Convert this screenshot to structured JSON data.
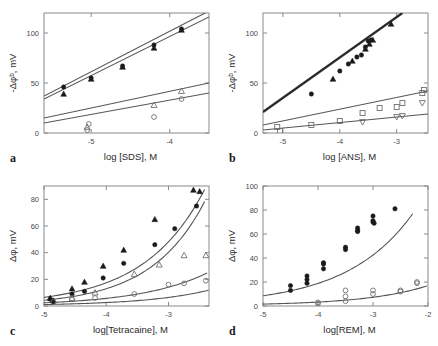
{
  "figure": {
    "background": "#ffffff",
    "width": 438,
    "height": 346,
    "marker_filled_color": "#1a1a1a",
    "marker_open_color": "#707070",
    "curve_color": "#555555",
    "axis_color": "#8a8a8a"
  },
  "panels": [
    {
      "letter": "a",
      "xlabel": "log [SDS], M",
      "ylabel": "-Δφᵇ, mV"
    },
    {
      "letter": "b",
      "xlabel": "log [ANS], M",
      "ylabel": "-Δφᵇ, mV"
    },
    {
      "letter": "c",
      "xlabel": "log[Tetracaine], M",
      "ylabel": "Δφ, mV"
    },
    {
      "letter": "d",
      "xlabel": "log[REM], M",
      "ylabel": "Δφ, mV"
    }
  ],
  "chart_data": [
    {
      "id": "panel-a",
      "type": "scatter",
      "title": "",
      "xlabel": "log [SDS], M",
      "ylabel": "-Δφᵇ, mV",
      "xlim": [
        -5.6,
        -3.5
      ],
      "ylim": [
        0,
        120
      ],
      "xticks": [
        -5,
        -4
      ],
      "yticks": [
        0,
        50,
        100
      ],
      "grid": false,
      "legend": "none",
      "series": [
        {
          "name": "filled-circle",
          "marker": "filled-circle",
          "x": [
            -5.35,
            -5.0,
            -4.6,
            -4.2,
            -3.85
          ],
          "y": [
            46,
            55,
            67,
            88,
            104
          ]
        },
        {
          "name": "filled-triangle",
          "marker": "filled-triangle",
          "x": [
            -5.35,
            -5.0,
            -4.6,
            -4.2,
            -3.85
          ],
          "y": [
            39,
            54,
            66,
            85,
            103
          ]
        },
        {
          "name": "open-triangle",
          "marker": "open-triangle",
          "x": [
            -5.05,
            -4.2,
            -3.85
          ],
          "y": [
            6,
            28,
            42
          ]
        },
        {
          "name": "open-circle",
          "marker": "open-circle",
          "x": [
            -5.05,
            -5.03,
            -4.2,
            -3.85
          ],
          "y": [
            3,
            9,
            16,
            34
          ]
        }
      ],
      "fit_lines": [
        {
          "name": "upper-fit-1",
          "from_x": -5.6,
          "from_y": 37,
          "to_x": -3.5,
          "to_y": 122
        },
        {
          "name": "upper-fit-2",
          "from_x": -5.6,
          "from_y": 34,
          "to_x": -3.5,
          "to_y": 116
        },
        {
          "name": "lower-fit-1",
          "from_x": -5.6,
          "from_y": 15,
          "to_x": -3.5,
          "to_y": 50
        },
        {
          "name": "lower-fit-2",
          "from_x": -5.6,
          "from_y": 10,
          "to_x": -3.5,
          "to_y": 40
        }
      ]
    },
    {
      "id": "panel-b",
      "type": "scatter",
      "title": "",
      "xlabel": "log [ANS], M",
      "ylabel": "-Δφᵇ, mV",
      "xlim": [
        -5.35,
        -2.45
      ],
      "ylim": [
        0,
        120
      ],
      "xticks": [
        -5,
        -4,
        -3
      ],
      "yticks": [
        0,
        50,
        100
      ],
      "grid": false,
      "legend": "none",
      "series": [
        {
          "name": "filled-circle",
          "marker": "filled-circle",
          "x": [
            -4.5,
            -4.0,
            -3.85,
            -3.7,
            -3.62,
            -3.55,
            -3.5,
            -3.45
          ],
          "y": [
            39,
            62,
            69,
            76,
            78,
            86,
            92,
            93
          ]
        },
        {
          "name": "filled-triangle",
          "marker": "filled-triangle",
          "x": [
            -4.12,
            -3.78,
            -3.55,
            -3.48,
            -3.42,
            -3.1
          ],
          "y": [
            54,
            72,
            84,
            89,
            93,
            109
          ]
        },
        {
          "name": "open-square",
          "marker": "open-square",
          "x": [
            -5.1,
            -5.05,
            -4.5,
            -4.0,
            -3.6,
            -3.3,
            -3.0,
            -2.9,
            -2.55,
            -2.52
          ],
          "y": [
            6,
            2,
            8,
            12,
            20,
            25,
            26,
            30,
            40,
            43
          ]
        },
        {
          "name": "open-inverted-triangle",
          "marker": "open-inverted-triangle",
          "x": [
            -3.6,
            -3.0,
            -2.9,
            -2.55
          ],
          "y": [
            11,
            16,
            17,
            30
          ]
        }
      ],
      "fit_lines": [
        {
          "name": "bold-fit",
          "from_x": -5.35,
          "from_y": 21,
          "to_x": -2.9,
          "to_y": 120
        },
        {
          "name": "mid-fit",
          "from_x": -5.35,
          "from_y": 8,
          "to_x": -2.45,
          "to_y": 42
        },
        {
          "name": "low-fit",
          "from_x": -5.35,
          "from_y": 3,
          "to_x": -2.45,
          "to_y": 19
        }
      ]
    },
    {
      "id": "panel-c",
      "type": "scatter",
      "title": "",
      "xlabel": "log[Tetracaine], M",
      "ylabel": "Δφ, mV",
      "xlim": [
        -5.0,
        -2.35
      ],
      "ylim": [
        0,
        90
      ],
      "xticks": [
        -5,
        -4,
        -3
      ],
      "yticks": [
        0,
        20,
        40,
        60,
        80
      ],
      "grid": false,
      "legend": "none",
      "series": [
        {
          "name": "filled-triangle",
          "marker": "filled-triangle",
          "x": [
            -4.9,
            -4.85,
            -4.55,
            -4.35,
            -4.05,
            -3.72,
            -3.22,
            -2.6,
            -2.5
          ],
          "y": [
            6,
            4,
            13,
            18,
            30,
            42,
            65,
            87,
            86
          ]
        },
        {
          "name": "filled-circle",
          "marker": "filled-circle",
          "x": [
            -4.9,
            -4.85,
            -4.55,
            -4.35,
            -4.05,
            -3.72,
            -3.22,
            -2.9,
            -2.55
          ],
          "y": [
            5,
            3,
            9,
            11,
            21,
            32,
            46,
            58,
            75
          ]
        },
        {
          "name": "open-triangle",
          "marker": "open-triangle",
          "x": [
            -4.55,
            -4.18,
            -3.55,
            -3.15,
            -2.75,
            -2.4
          ],
          "y": [
            6,
            10,
            24,
            31,
            38,
            38
          ]
        },
        {
          "name": "open-circle",
          "marker": "open-circle",
          "x": [
            -4.85,
            -4.55,
            -4.18,
            -3.55,
            -3.0,
            -2.75,
            -2.4
          ],
          "y": [
            3,
            5,
            6,
            9,
            16,
            17,
            19
          ]
        }
      ],
      "fit_curves": [
        {
          "name": "top-curve"
        },
        {
          "name": "second-curve"
        },
        {
          "name": "third-curve"
        },
        {
          "name": "bottom-curve"
        }
      ]
    },
    {
      "id": "panel-d",
      "type": "scatter",
      "title": "",
      "xlabel": "log[REM], M",
      "ylabel": "Δφ, mV",
      "xlim": [
        -5.0,
        -2.0
      ],
      "ylim": [
        0,
        100
      ],
      "xticks": [
        -5,
        -4,
        -3,
        -2
      ],
      "yticks": [
        0,
        20,
        40,
        60,
        80,
        100
      ],
      "grid": false,
      "legend": "none",
      "series": [
        {
          "name": "filled-circle",
          "marker": "filled-circle",
          "x": [
            -4.5,
            -4.5,
            -4.2,
            -4.2,
            -4.2,
            -3.9,
            -3.9,
            -3.9,
            -3.5,
            -3.5,
            -3.28,
            -3.28,
            -3.28,
            -3.0,
            -3.0,
            -3.0,
            -2.98,
            -2.6
          ],
          "y": [
            17,
            13,
            25,
            22,
            19,
            36,
            35,
            31,
            49,
            47,
            65,
            63,
            62,
            75,
            71,
            70,
            69,
            81
          ]
        },
        {
          "name": "open-circle",
          "marker": "open-circle",
          "x": [
            -4.0,
            -4.0,
            -3.5,
            -3.5,
            -3.5,
            -3.0,
            -3.0,
            -2.5,
            -2.5,
            -2.2,
            -2.2
          ],
          "y": [
            3,
            2,
            13,
            8,
            4,
            13,
            10,
            13,
            12,
            20,
            19
          ]
        }
      ],
      "fit_curves": [
        {
          "name": "upper-curve"
        },
        {
          "name": "lower-curve"
        }
      ]
    }
  ]
}
